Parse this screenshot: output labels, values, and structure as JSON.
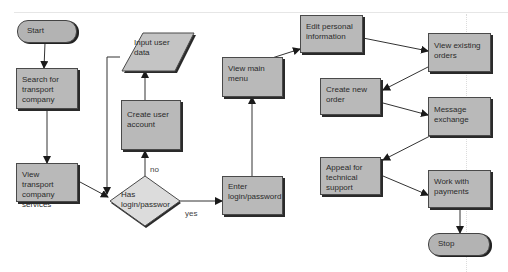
{
  "diagram": {
    "type": "flowchart",
    "colors": {
      "process_fill": "#b9b9b9",
      "decision_fill": "#dcdcdc",
      "io_fill": "#c4c4c4",
      "stroke": "#4a4a4a",
      "background": "#ffffff"
    },
    "nodes": {
      "start": {
        "shape": "terminator",
        "label": "Start"
      },
      "search": {
        "shape": "process",
        "label": "Search for transport company"
      },
      "view_transport": {
        "shape": "process",
        "label": "View transport company services"
      },
      "has_login": {
        "shape": "decision",
        "label": "Has login/passwor"
      },
      "create_account": {
        "shape": "process",
        "label": "Create user account"
      },
      "input_data": {
        "shape": "data",
        "label": "Input user data"
      },
      "enter_login": {
        "shape": "process",
        "label": "Enter login/password"
      },
      "view_menu": {
        "shape": "process",
        "label": "View main menu"
      },
      "edit_personal": {
        "shape": "process",
        "label": "Edit personal information"
      },
      "create_order": {
        "shape": "process",
        "label": "Create new order"
      },
      "appeal": {
        "shape": "process",
        "label": "Appeal for technical support"
      },
      "view_orders": {
        "shape": "process",
        "label": "View existing orders"
      },
      "message": {
        "shape": "process",
        "label": "Message exchange"
      },
      "payments": {
        "shape": "process",
        "label": "Work with payments"
      },
      "stop": {
        "shape": "terminator",
        "label": "Stop"
      }
    },
    "edge_labels": {
      "no": "no",
      "yes": "yes"
    },
    "edges": [
      {
        "from": "start",
        "to": "search"
      },
      {
        "from": "search",
        "to": "view_transport"
      },
      {
        "from": "view_transport",
        "to": "has_login"
      },
      {
        "from": "input_data",
        "to": "has_login"
      },
      {
        "from": "has_login",
        "to": "create_account",
        "label": "no"
      },
      {
        "from": "create_account",
        "to": "input_data"
      },
      {
        "from": "has_login",
        "to": "enter_login",
        "label": "yes"
      },
      {
        "from": "enter_login",
        "to": "view_menu"
      },
      {
        "from": "view_menu",
        "to": "edit_personal"
      },
      {
        "from": "edit_personal",
        "to": "view_orders"
      },
      {
        "from": "view_orders",
        "to": "create_order"
      },
      {
        "from": "create_order",
        "to": "message"
      },
      {
        "from": "message",
        "to": "appeal"
      },
      {
        "from": "appeal",
        "to": "payments"
      },
      {
        "from": "payments",
        "to": "stop"
      }
    ]
  }
}
